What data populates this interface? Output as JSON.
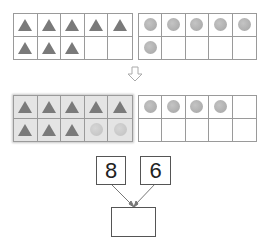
{
  "top_left_frame": {
    "cells": [
      "triangle",
      "triangle",
      "triangle",
      "triangle",
      "triangle",
      "triangle",
      "triangle",
      "triangle",
      "empty",
      "empty"
    ]
  },
  "top_right_frame": {
    "cells": [
      "circle",
      "circle",
      "circle",
      "circle",
      "circle",
      "circle",
      "empty",
      "empty",
      "empty",
      "empty"
    ]
  },
  "arrow": {
    "icon": "down-arrow-icon"
  },
  "bottom_left_frame": {
    "highlighted": true,
    "cells": [
      "triangle",
      "triangle",
      "triangle",
      "triangle",
      "triangle",
      "triangle",
      "triangle",
      "triangle",
      "circle-faint",
      "circle-faint"
    ]
  },
  "bottom_right_frame": {
    "cells": [
      "circle",
      "circle",
      "circle",
      "circle",
      "empty",
      "empty",
      "empty",
      "empty",
      "empty",
      "empty"
    ]
  },
  "number_bond": {
    "left": "8",
    "right": "6",
    "result": ""
  },
  "colors": {
    "triangle": "#7a7a7a",
    "circle": "#b0b0b0",
    "grid_line": "#9a9a9a",
    "highlight": "#e4e4e4"
  }
}
